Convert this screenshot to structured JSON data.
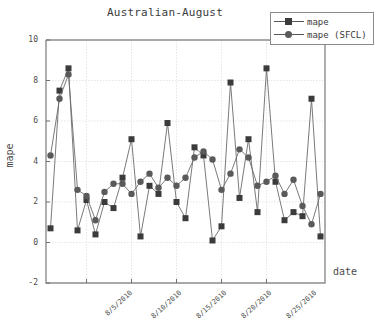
{
  "chart_data": {
    "type": "line",
    "title": "Australian-August",
    "xlabel": "date",
    "ylabel": "mape",
    "ylim": [
      -2,
      10
    ],
    "yticks": [
      -2,
      0,
      2,
      4,
      6,
      8,
      10
    ],
    "xtick_labels": [
      "8/5/2010",
      "8/10/2010",
      "8/15/2010",
      "8/20/2010",
      "8/25/2010"
    ],
    "xtick_indices": [
      4,
      9,
      14,
      19,
      24
    ],
    "grid": true,
    "legend_position": "top-right",
    "x": [
      1,
      2,
      3,
      4,
      5,
      6,
      7,
      8,
      9,
      10,
      11,
      12,
      13,
      14,
      15,
      16,
      17,
      18,
      19,
      20,
      21,
      22,
      23,
      24,
      25,
      26,
      27,
      28,
      29,
      30,
      31
    ],
    "series": [
      {
        "name": "mape",
        "marker": "square",
        "color": "#3b3b3b",
        "values": [
          0.7,
          7.5,
          8.6,
          0.6,
          2.1,
          0.4,
          2.0,
          1.7,
          3.2,
          5.1,
          0.3,
          2.8,
          2.4,
          5.9,
          2.0,
          1.2,
          4.7,
          4.3,
          0.1,
          0.8,
          7.9,
          2.2,
          5.1,
          1.5,
          8.6,
          3.0,
          1.1,
          1.5,
          1.3,
          7.1,
          0.3
        ]
      },
      {
        "name": "mape (SFCL)",
        "marker": "circle",
        "color": "#5a5a5a",
        "values": [
          4.3,
          7.1,
          8.3,
          2.6,
          2.3,
          1.1,
          2.5,
          2.9,
          2.9,
          2.4,
          3.0,
          3.4,
          2.7,
          3.2,
          2.8,
          3.2,
          4.2,
          4.5,
          4.1,
          2.6,
          3.4,
          4.6,
          4.2,
          2.8,
          3.0,
          3.3,
          2.4,
          3.1,
          1.8,
          0.9,
          2.4
        ]
      }
    ]
  },
  "legend": {
    "items": [
      {
        "label": "mape"
      },
      {
        "label": "mape (SFCL)"
      }
    ]
  }
}
